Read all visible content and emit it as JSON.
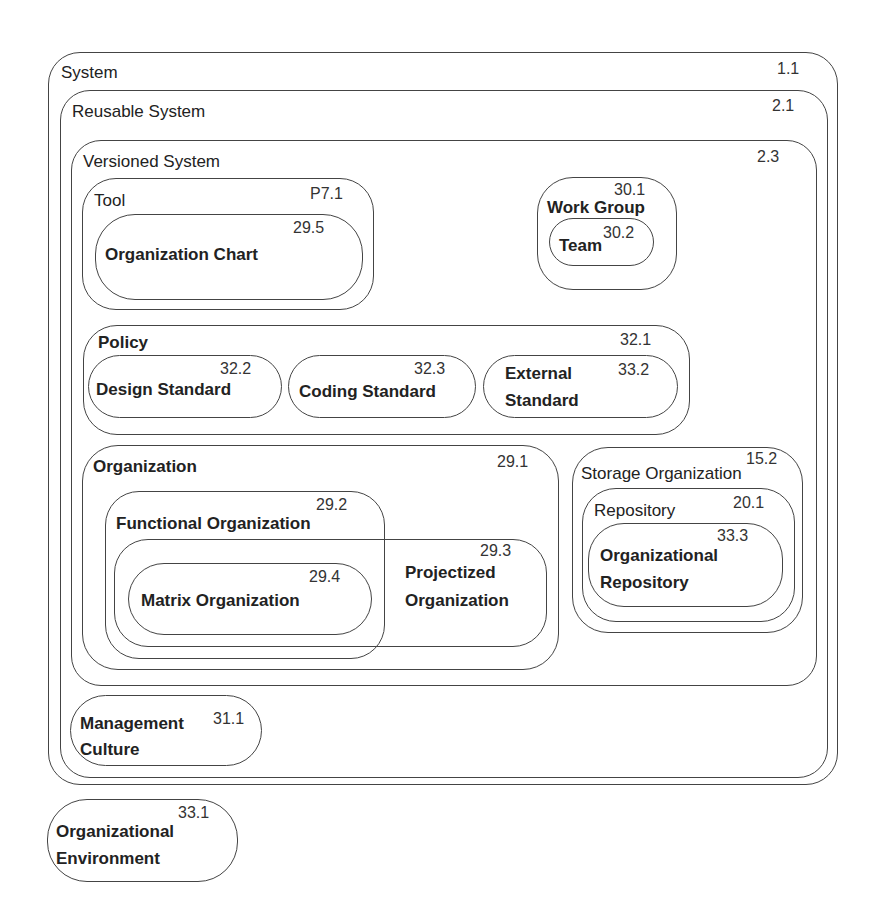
{
  "diagram": {
    "type": "nested-containment",
    "nodes": {
      "system": {
        "label": "System",
        "id": "1.1"
      },
      "reusable_system": {
        "label": "Reusable System",
        "id": "2.1"
      },
      "versioned_system": {
        "label": "Versioned System",
        "id": "2.3"
      },
      "tool": {
        "label": "Tool",
        "id": "P7.1"
      },
      "organization_chart": {
        "label": "Organization Chart",
        "id": "29.5"
      },
      "work_group": {
        "label": "Work Group",
        "id": "30.1"
      },
      "team": {
        "label": "Team",
        "id": "30.2"
      },
      "policy": {
        "label": "Policy",
        "id": "32.1"
      },
      "design_standard": {
        "label": "Design Standard",
        "id": "32.2"
      },
      "coding_standard": {
        "label": "Coding Standard",
        "id": "32.3"
      },
      "external_standard": {
        "label_line1": "External",
        "label_line2": "Standard",
        "id": "33.2"
      },
      "organization": {
        "label": "Organization",
        "id": "29.1"
      },
      "functional_organization": {
        "label": "Functional Organization",
        "id": "29.2"
      },
      "projectized_organization": {
        "label_line1": "Projectized",
        "label_line2": "Organization",
        "id": "29.3"
      },
      "matrix_organization": {
        "label": "Matrix Organization",
        "id": "29.4"
      },
      "storage_organization": {
        "label": "Storage Organization",
        "id": "15.2"
      },
      "repository": {
        "label": "Repository",
        "id": "20.1"
      },
      "organizational_repository": {
        "label_line1": "Organizational",
        "label_line2": "Repository",
        "id": "33.3"
      },
      "management_culture": {
        "label_line1": "Management",
        "label_line2": "Culture",
        "id": "31.1"
      },
      "organizational_environment": {
        "label_line1": "Organizational",
        "label_line2": "Environment",
        "id": "33.1"
      }
    }
  }
}
